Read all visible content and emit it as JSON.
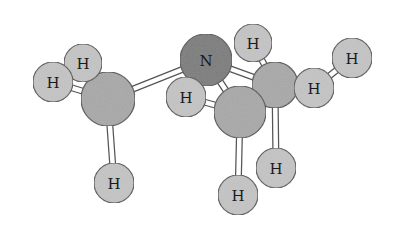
{
  "diagram": {
    "title": "",
    "type": "ball-and-stick molecular model",
    "colors": {
      "background": "#ffffff",
      "carbon": "#a8a8a8",
      "nitrogen": "#7a7a7a",
      "hydrogen": "#c4c4c4",
      "outline": "#555555",
      "bond": "#ffffff"
    },
    "atoms": [
      {
        "id": "C1",
        "label": "",
        "x": 108,
        "y": 99,
        "r": 27,
        "kind": "carbon"
      },
      {
        "id": "H1",
        "label": "H",
        "x": 83,
        "y": 63,
        "r": 19,
        "kind": "hydrogen"
      },
      {
        "id": "H2",
        "label": "H",
        "x": 53,
        "y": 82,
        "r": 20,
        "kind": "hydrogen"
      },
      {
        "id": "H3",
        "label": "H",
        "x": 114,
        "y": 183,
        "r": 20,
        "kind": "hydrogen"
      },
      {
        "id": "N",
        "label": "N",
        "x": 206,
        "y": 60,
        "r": 26,
        "kind": "nitrogen"
      },
      {
        "id": "HN",
        "label": "H",
        "x": 186,
        "y": 97,
        "r": 20,
        "kind": "hydrogen"
      },
      {
        "id": "H4",
        "label": "H",
        "x": 253,
        "y": 43,
        "r": 19,
        "kind": "hydrogen"
      },
      {
        "id": "C3",
        "label": "",
        "x": 275,
        "y": 85,
        "r": 23,
        "kind": "carbon"
      },
      {
        "id": "H6",
        "label": "H",
        "x": 352,
        "y": 58,
        "r": 20,
        "kind": "hydrogen"
      },
      {
        "id": "H5",
        "label": "H",
        "x": 314,
        "y": 88,
        "r": 20,
        "kind": "hydrogen"
      },
      {
        "id": "C2",
        "label": "",
        "x": 240,
        "y": 112,
        "r": 26,
        "kind": "carbon"
      },
      {
        "id": "H7",
        "label": "H",
        "x": 276,
        "y": 168,
        "r": 20,
        "kind": "hydrogen"
      },
      {
        "id": "H8",
        "label": "H",
        "x": 238,
        "y": 195,
        "r": 20,
        "kind": "hydrogen"
      }
    ],
    "bonds": [
      [
        "C1",
        "H1"
      ],
      [
        "C1",
        "H2"
      ],
      [
        "C1",
        "H3"
      ],
      [
        "C1",
        "N"
      ],
      [
        "N",
        "HN"
      ],
      [
        "N",
        "C2"
      ],
      [
        "N",
        "C3"
      ],
      [
        "C3",
        "H4"
      ],
      [
        "C3",
        "H5"
      ],
      [
        "C3",
        "H7"
      ],
      [
        "C3",
        "C2"
      ],
      [
        "H5",
        "H6"
      ],
      [
        "C2",
        "H8"
      ],
      [
        "C2",
        "HN"
      ]
    ]
  }
}
